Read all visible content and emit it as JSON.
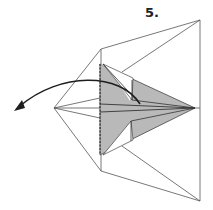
{
  "diagram": {
    "step_label": "5.",
    "colors": {
      "line": "#555555",
      "paper_gray": "#b9b9b9",
      "arrow": "#1e1e1e",
      "background": "#ffffff"
    },
    "instruction": "Fold the flap to the left along the dashed line (valley fold), arrow indicates direction"
  }
}
